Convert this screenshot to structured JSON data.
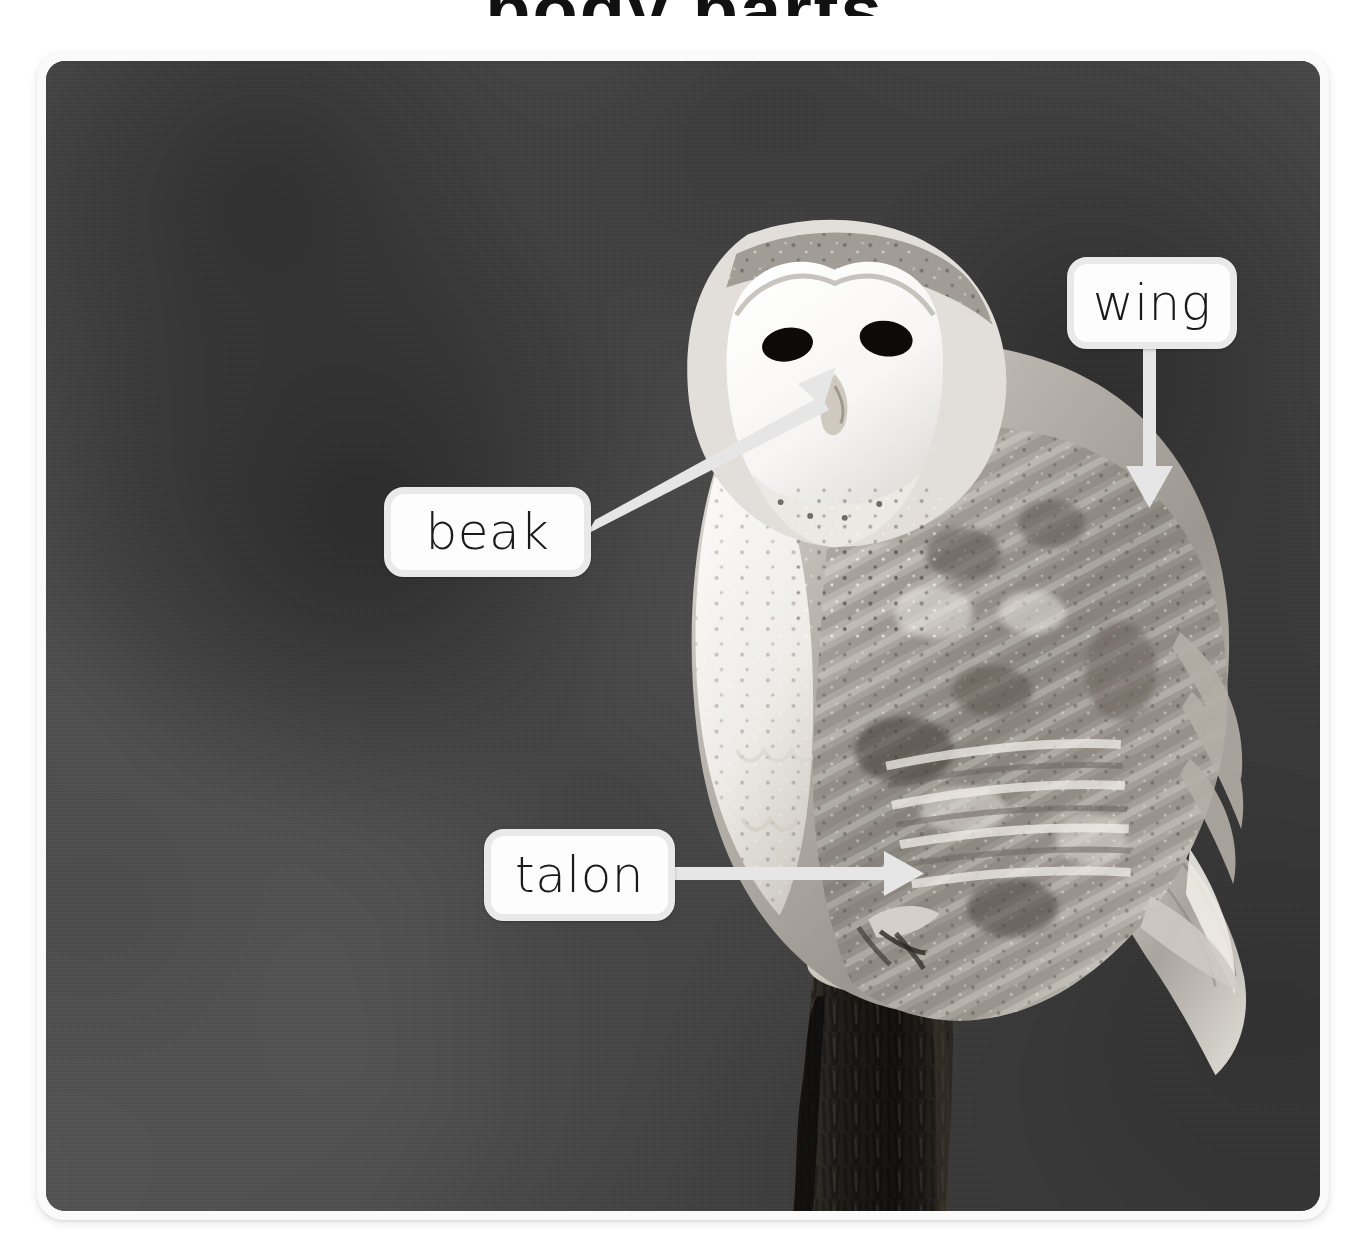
{
  "page": {
    "title_fragment": "body parts",
    "image_style": "grayscale photograph, blurred background"
  },
  "photo": {
    "alt": "Barn owl perched on a tree stump",
    "frame_color": "#fafafa",
    "background_color": "#4e4e4e"
  },
  "labels": [
    {
      "id": "wing",
      "text": "wing",
      "arrow_direction": "down",
      "points_to": "folded wing feathers"
    },
    {
      "id": "beak",
      "text": "beak",
      "arrow_direction": "up-right",
      "points_to": "beak on facial disc"
    },
    {
      "id": "talon",
      "text": "talon",
      "arrow_direction": "right",
      "points_to": "talons gripping stump"
    }
  ],
  "colors": {
    "callout_fill": "#fdfdfd",
    "callout_border": "#e9e9e9",
    "arrow": "#e6e6e6",
    "text": "#1a1a1a"
  }
}
